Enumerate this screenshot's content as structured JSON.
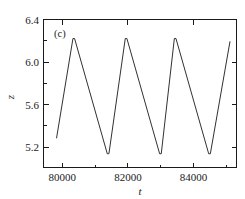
{
  "figure": {
    "panel_label": "(c)",
    "background_color": "#ffffff",
    "line_color": "#1a1a1a"
  },
  "chart_data": {
    "type": "line",
    "title": "",
    "subtitle": "",
    "panel_label": "(c)",
    "xlabel": "t",
    "ylabel": "z",
    "xlim": [
      79400,
      85300
    ],
    "ylim": [
      5.0,
      6.4
    ],
    "xticks": [
      80000,
      82000,
      84000
    ],
    "xtick_labels": [
      "80000",
      "82000",
      "84000"
    ],
    "x_minor_ticks": [
      81000,
      83000,
      85000
    ],
    "yticks": [
      5.2,
      5.6,
      6.0,
      6.4
    ],
    "ytick_labels": [
      "5.2",
      "5.6",
      "6.0",
      "6.4"
    ],
    "y_minor_ticks": [
      5.4,
      5.8,
      6.2
    ],
    "grid": false,
    "legend": null,
    "legend_position": "none",
    "annotations": [
      {
        "text": "(c)",
        "x": 79650,
        "y": 6.3
      }
    ],
    "series": [
      {
        "name": "z(t)",
        "color": "#1a1a1a",
        "x": [
          79800,
          80300,
          80350,
          81350,
          81400,
          81900,
          81950,
          82950,
          83000,
          83400,
          83450,
          84450,
          84500,
          85100
        ],
        "y": [
          5.28,
          6.22,
          6.22,
          5.13,
          5.13,
          6.22,
          6.22,
          5.13,
          5.13,
          6.22,
          6.22,
          5.13,
          5.13,
          6.19
        ]
      }
    ],
    "waveform_description": {
      "shape": "sawtooth relaxation oscillation",
      "peak_value": 6.22,
      "trough_value": 5.13,
      "period": 1550,
      "cycles_shown": 3
    }
  }
}
